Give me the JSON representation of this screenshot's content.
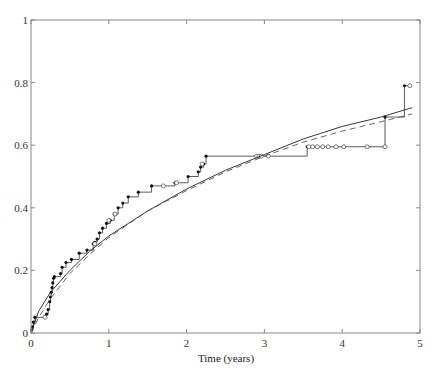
{
  "chart_data": {
    "type": "line",
    "title": "",
    "xlabel": "Time (years)",
    "ylabel": "",
    "xlim": [
      0,
      5
    ],
    "ylim": [
      0,
      1
    ],
    "x_ticks": [
      "0",
      "1",
      "2",
      "3",
      "4",
      "5"
    ],
    "y_ticks": [
      "0",
      "0.2",
      "0.4",
      "0.6",
      "0.8",
      "1"
    ],
    "grid": false,
    "legend": null,
    "series": [
      {
        "name": "Nonparametric step estimate",
        "style": "step",
        "color": "#333333",
        "points": [
          [
            0.0,
            0.0
          ],
          [
            0.01,
            0.01
          ],
          [
            0.02,
            0.02
          ],
          [
            0.03,
            0.035
          ],
          [
            0.05,
            0.05
          ],
          [
            0.2,
            0.06
          ],
          [
            0.22,
            0.075
          ],
          [
            0.24,
            0.1
          ],
          [
            0.25,
            0.115
          ],
          [
            0.26,
            0.13
          ],
          [
            0.27,
            0.145
          ],
          [
            0.28,
            0.16
          ],
          [
            0.29,
            0.175
          ],
          [
            0.3,
            0.18
          ],
          [
            0.38,
            0.19
          ],
          [
            0.4,
            0.21
          ],
          [
            0.45,
            0.225
          ],
          [
            0.52,
            0.235
          ],
          [
            0.62,
            0.255
          ],
          [
            0.72,
            0.265
          ],
          [
            0.8,
            0.285
          ],
          [
            0.82,
            0.29
          ],
          [
            0.85,
            0.3
          ],
          [
            0.88,
            0.32
          ],
          [
            0.92,
            0.335
          ],
          [
            0.97,
            0.35
          ],
          [
            1.02,
            0.36
          ],
          [
            1.07,
            0.38
          ],
          [
            1.12,
            0.4
          ],
          [
            1.18,
            0.415
          ],
          [
            1.25,
            0.435
          ],
          [
            1.38,
            0.45
          ],
          [
            1.55,
            0.47
          ],
          [
            1.85,
            0.48
          ],
          [
            2.02,
            0.5
          ],
          [
            2.15,
            0.515
          ],
          [
            2.18,
            0.53
          ],
          [
            2.22,
            0.54
          ],
          [
            2.25,
            0.565
          ],
          [
            3.55,
            0.595
          ],
          [
            4.55,
            0.69
          ],
          [
            4.8,
            0.79
          ]
        ],
        "censored": [
          [
            0.18,
            0.05
          ],
          [
            0.82,
            0.285
          ],
          [
            1.0,
            0.36
          ],
          [
            1.08,
            0.38
          ],
          [
            1.7,
            0.47
          ],
          [
            1.87,
            0.48
          ],
          [
            2.2,
            0.54
          ],
          [
            2.9,
            0.565
          ],
          [
            2.93,
            0.565
          ],
          [
            2.96,
            0.565
          ],
          [
            3.05,
            0.565
          ],
          [
            3.57,
            0.595
          ],
          [
            3.62,
            0.595
          ],
          [
            3.68,
            0.595
          ],
          [
            3.75,
            0.595
          ],
          [
            3.82,
            0.595
          ],
          [
            3.92,
            0.595
          ],
          [
            4.02,
            0.595
          ],
          [
            4.32,
            0.595
          ],
          [
            4.55,
            0.595
          ],
          [
            4.87,
            0.79
          ]
        ]
      },
      {
        "name": "Parametric fit (solid)",
        "style": "solid",
        "color": "#222222",
        "x": [
          0,
          0.1,
          0.25,
          0.5,
          0.75,
          1.0,
          1.5,
          2.0,
          2.5,
          3.0,
          3.5,
          4.0,
          4.5,
          4.9
        ],
        "values": [
          0.0,
          0.07,
          0.13,
          0.2,
          0.26,
          0.31,
          0.39,
          0.46,
          0.52,
          0.57,
          0.62,
          0.66,
          0.69,
          0.72
        ]
      },
      {
        "name": "Parametric fit (dashed)",
        "style": "dashed",
        "color": "#555555",
        "x": [
          0,
          0.1,
          0.25,
          0.5,
          0.75,
          1.0,
          1.5,
          2.0,
          2.5,
          3.0,
          3.5,
          4.0,
          4.5,
          4.9
        ],
        "values": [
          0.0,
          0.05,
          0.11,
          0.19,
          0.25,
          0.305,
          0.39,
          0.455,
          0.515,
          0.565,
          0.61,
          0.645,
          0.675,
          0.7
        ]
      }
    ]
  }
}
